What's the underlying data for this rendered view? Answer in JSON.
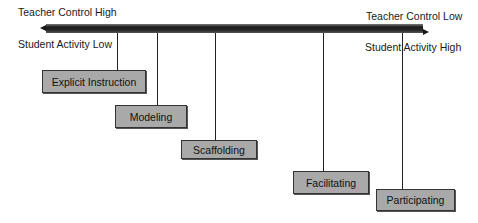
{
  "axis": {
    "top_left": "Teacher Control High",
    "bottom_left": "Student Activity Low",
    "top_right": "Teacher Control Low",
    "bottom_right": "Student Activity High"
  },
  "stages": [
    {
      "label": "Explicit Instruction"
    },
    {
      "label": "Modeling"
    },
    {
      "label": "Scaffolding"
    },
    {
      "label": "Facilitating"
    },
    {
      "label": "Participating"
    }
  ],
  "colors": {
    "box_fill": "#a9a9a9",
    "bar": "#1a1a1a"
  }
}
